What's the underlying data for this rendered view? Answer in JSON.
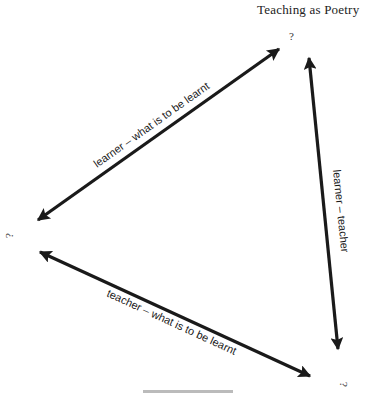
{
  "header": {
    "running_title": "Teaching as Poetry"
  },
  "diagram": {
    "nodes": [
      {
        "id": "top",
        "label": "?"
      },
      {
        "id": "left",
        "label": "?"
      },
      {
        "id": "bottom",
        "label": "?"
      }
    ],
    "edges": [
      {
        "from": "left",
        "to": "top",
        "label": "learner – what is to be learnt",
        "direction": "both"
      },
      {
        "from": "top",
        "to": "bottom",
        "label": "learner – teacher",
        "direction": "both"
      },
      {
        "from": "left",
        "to": "bottom",
        "label": "teacher – what is to be learnt",
        "direction": "both"
      }
    ],
    "caption": "Fig. 1.1  (partially cut off)"
  },
  "colors": {
    "ink": "#1a1a1a",
    "background": "#ffffff"
  }
}
